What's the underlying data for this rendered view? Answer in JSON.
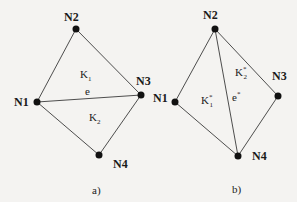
{
  "diagrams": [
    {
      "id": "a",
      "caption": "a)",
      "nodes": [
        {
          "label": "N1",
          "x": 37,
          "y": 102,
          "lx": 14,
          "ly": 106
        },
        {
          "label": "N2",
          "x": 76,
          "y": 29,
          "lx": 64,
          "ly": 21
        },
        {
          "label": "N3",
          "x": 141,
          "y": 95,
          "lx": 136,
          "ly": 85
        },
        {
          "label": "N4",
          "x": 99,
          "y": 155,
          "lx": 113,
          "ly": 168
        }
      ],
      "edges": [
        [
          "N1",
          "N2"
        ],
        [
          "N2",
          "N3"
        ],
        [
          "N1",
          "N3"
        ],
        [
          "N1",
          "N4"
        ],
        [
          "N3",
          "N4"
        ]
      ],
      "element_labels": [
        {
          "main": "K",
          "sub": "1",
          "sup": "",
          "x": 80,
          "y": 78
        },
        {
          "main": "K",
          "sub": "2",
          "sup": "",
          "x": 89,
          "y": 121
        }
      ],
      "edge_label": {
        "main": "e",
        "sup": "",
        "x": 85,
        "y": 95
      },
      "caption_pos": {
        "x": 92,
        "y": 194
      }
    },
    {
      "id": "b",
      "caption": "b)",
      "nodes": [
        {
          "label": "N1",
          "x": 175,
          "y": 102,
          "lx": 153,
          "ly": 102
        },
        {
          "label": "N2",
          "x": 215,
          "y": 29,
          "lx": 203,
          "ly": 19
        },
        {
          "label": "N3",
          "x": 278,
          "y": 96,
          "lx": 272,
          "ly": 80
        },
        {
          "label": "N4",
          "x": 238,
          "y": 156,
          "lx": 252,
          "ly": 160
        },
        {
          "label": "",
          "x": 0,
          "y": 0,
          "lx": 0,
          "ly": 0
        }
      ],
      "edges": [
        [
          "N1",
          "N2"
        ],
        [
          "N2",
          "N3"
        ],
        [
          "N2",
          "N4"
        ],
        [
          "N1",
          "N4"
        ],
        [
          "N3",
          "N4"
        ]
      ],
      "element_labels": [
        {
          "main": "K",
          "sub": "1",
          "sup": "*",
          "x": 201,
          "y": 104
        },
        {
          "main": "K",
          "sub": "2",
          "sup": "*",
          "x": 235,
          "y": 76
        }
      ],
      "edge_label": {
        "main": "e",
        "sup": "*",
        "x": 232,
        "y": 101
      },
      "caption_pos": {
        "x": 232,
        "y": 193
      }
    }
  ]
}
